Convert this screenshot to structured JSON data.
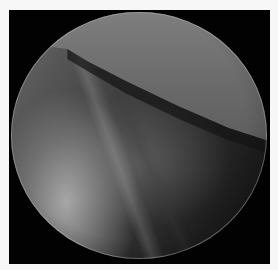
{
  "image": {
    "type": "endoscopic-circular-view",
    "colors": {
      "background": "#f7f7f7",
      "frame": "#020202",
      "upper_tissue": "#6a6a6a",
      "lower_left_highlight": "#b4b4b4",
      "lower_right_shadow": "#1e1e1e"
    }
  }
}
